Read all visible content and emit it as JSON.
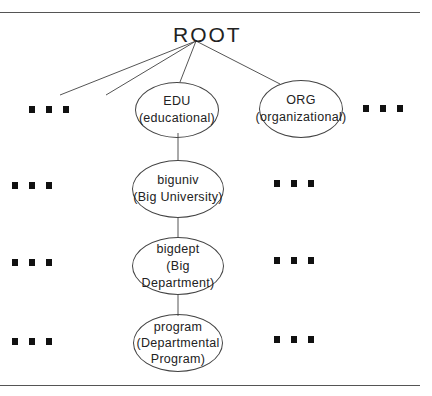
{
  "diagram": {
    "root": {
      "label": "ROOT"
    },
    "top_level": [
      {
        "name": "EDU",
        "desc": "(educational)"
      },
      {
        "name": "ORG",
        "desc": "(organizational)"
      }
    ],
    "chain": [
      {
        "name": "biguniv",
        "desc": "(Big University)"
      },
      {
        "name": "bigdept",
        "desc": "(Big Department)"
      },
      {
        "name": "program",
        "desc": "(Departmental",
        "desc2": "Program)"
      }
    ],
    "ellipsis_marker": "..."
  }
}
